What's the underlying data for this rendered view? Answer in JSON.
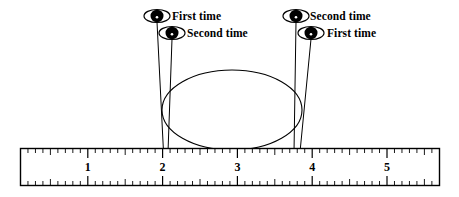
{
  "figure": {
    "width": 459,
    "height": 197,
    "background_color": "#ffffff",
    "ink_color": "#000000"
  },
  "callouts": [
    {
      "id": "left-first",
      "label": "First time",
      "marker_icon": "eye-marker-icon",
      "marker_x": 157,
      "marker_y": 16,
      "label_x": 172,
      "label_y": 11,
      "anchor_x": 163.5,
      "anchor_y": 152,
      "ruler_value": 2.05
    },
    {
      "id": "left-second",
      "label": "Second time",
      "marker_icon": "eye-marker-icon",
      "marker_x": 172,
      "marker_y": 33,
      "label_x": 187,
      "label_y": 28,
      "anchor_x": 168,
      "anchor_y": 152,
      "ruler_value": 2.2
    },
    {
      "id": "right-second",
      "label": "Second time",
      "marker_icon": "eye-marker-icon",
      "marker_x": 296,
      "marker_y": 16,
      "label_x": 310,
      "label_y": 11,
      "anchor_x": 294,
      "anchor_y": 152,
      "ruler_value": 3.75
    },
    {
      "id": "right-first",
      "label": "First time",
      "marker_icon": "eye-marker-icon",
      "marker_x": 311,
      "marker_y": 33,
      "label_x": 327,
      "label_y": 28,
      "anchor_x": 300,
      "anchor_y": 152,
      "ruler_value": 3.9
    }
  ],
  "ellipse": {
    "center_x": 232,
    "center_y": 110,
    "radius_x": 70,
    "radius_y": 40,
    "stroke_color": "#000000",
    "stroke_width": 1.1,
    "fill": "none"
  },
  "ruler": {
    "left": 20,
    "right": 440,
    "top": 148,
    "bottom": 186,
    "border_color": "#000000",
    "fill_color": "#ffffff",
    "origin_x": 13,
    "unit_px": 74.8,
    "minor_ticks_per_unit": 10,
    "numbers": [
      {
        "value": "1",
        "x": 87.8
      },
      {
        "value": "2",
        "x": 162.6
      },
      {
        "value": "3",
        "x": 237.4
      },
      {
        "value": "4",
        "x": 312.2
      },
      {
        "value": "5",
        "x": 387.0
      }
    ]
  }
}
